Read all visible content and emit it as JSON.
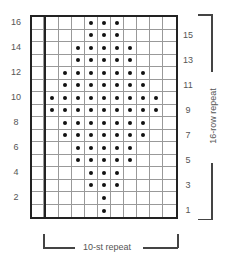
{
  "chart": {
    "rows": 16,
    "columns": 11,
    "edge_columns": 1,
    "repeat_columns": 10,
    "symbol": "dot",
    "dot_color": "#111111",
    "grid_color": "#999999",
    "border_color": "#222222",
    "dots_by_row": {
      "16": [
        4,
        5,
        6
      ],
      "15": [
        4,
        5,
        6
      ],
      "14": [
        3,
        4,
        5,
        6,
        7
      ],
      "13": [
        3,
        4,
        5,
        6,
        7
      ],
      "12": [
        2,
        3,
        4,
        5,
        6,
        7,
        8
      ],
      "11": [
        2,
        3,
        4,
        5,
        6,
        7,
        8
      ],
      "10": [
        1,
        2,
        3,
        4,
        5,
        6,
        7,
        8,
        9
      ],
      "9": [
        1,
        2,
        3,
        4,
        5,
        6,
        7,
        8,
        9
      ],
      "8": [
        2,
        3,
        4,
        5,
        6,
        7,
        8
      ],
      "7": [
        2,
        3,
        4,
        5,
        6,
        7,
        8
      ],
      "6": [
        3,
        4,
        5,
        6,
        7
      ],
      "5": [
        3,
        4,
        5,
        6,
        7
      ],
      "4": [
        4,
        5,
        6
      ],
      "3": [
        4,
        5,
        6
      ],
      "2": [
        5
      ],
      "1": [
        5
      ]
    }
  },
  "labels": {
    "left_row_numbers": [
      "16",
      "14",
      "12",
      "10",
      "8",
      "6",
      "4",
      "2"
    ],
    "right_row_numbers": [
      "15",
      "13",
      "11",
      "9",
      "7",
      "5",
      "3",
      "1"
    ],
    "row_repeat": "16-row repeat",
    "stitch_repeat": "10-st repeat"
  }
}
